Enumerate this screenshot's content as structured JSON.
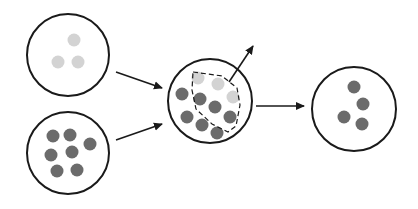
{
  "colors": {
    "background": "#ffffff",
    "outline": "#1a1a1a",
    "light_dot": "#d3d3d3",
    "dark_dot": "#6b6b6b"
  },
  "diagram": {
    "type": "flow",
    "nodes": [
      {
        "id": "source-light",
        "cx": 68,
        "cy": 55,
        "r": 41,
        "dots": [
          {
            "x": 74,
            "y": 40,
            "tone": "light"
          },
          {
            "x": 58,
            "y": 62,
            "tone": "light"
          },
          {
            "x": 78,
            "y": 62,
            "tone": "light"
          }
        ]
      },
      {
        "id": "source-dark",
        "cx": 68,
        "cy": 153,
        "r": 41,
        "dots": [
          {
            "x": 53,
            "y": 136,
            "tone": "dark"
          },
          {
            "x": 70,
            "y": 135,
            "tone": "dark"
          },
          {
            "x": 90,
            "y": 144,
            "tone": "dark"
          },
          {
            "x": 51,
            "y": 155,
            "tone": "dark"
          },
          {
            "x": 72,
            "y": 152,
            "tone": "dark"
          },
          {
            "x": 57,
            "y": 171,
            "tone": "dark"
          },
          {
            "x": 77,
            "y": 170,
            "tone": "dark"
          }
        ]
      },
      {
        "id": "combined",
        "cx": 210,
        "cy": 101,
        "r": 42,
        "dots": [
          {
            "x": 198,
            "y": 78,
            "tone": "light"
          },
          {
            "x": 218,
            "y": 84,
            "tone": "light"
          },
          {
            "x": 233,
            "y": 97,
            "tone": "light"
          },
          {
            "x": 182,
            "y": 94,
            "tone": "dark"
          },
          {
            "x": 200,
            "y": 99,
            "tone": "dark"
          },
          {
            "x": 215,
            "y": 107,
            "tone": "dark"
          },
          {
            "x": 230,
            "y": 117,
            "tone": "dark"
          },
          {
            "x": 187,
            "y": 117,
            "tone": "dark"
          },
          {
            "x": 202,
            "y": 125,
            "tone": "dark"
          },
          {
            "x": 217,
            "y": 133,
            "tone": "dark"
          }
        ]
      },
      {
        "id": "result",
        "cx": 354,
        "cy": 109,
        "r": 42,
        "dots": [
          {
            "x": 354,
            "y": 87,
            "tone": "dark"
          },
          {
            "x": 363,
            "y": 104,
            "tone": "dark"
          },
          {
            "x": 344,
            "y": 117,
            "tone": "dark"
          },
          {
            "x": 362,
            "y": 124,
            "tone": "dark"
          }
        ]
      }
    ],
    "dashed_subset": {
      "points": "193,72 222,76 237,88 240,105 236,126 228,132 212,124 196,109 192,90"
    },
    "edges": [
      {
        "id": "light-to-combined",
        "x1": 116,
        "y1": 72,
        "x2": 162,
        "y2": 88
      },
      {
        "id": "dark-to-combined",
        "x1": 116,
        "y1": 140,
        "x2": 162,
        "y2": 124
      },
      {
        "id": "subset-exit",
        "x1": 229,
        "y1": 82,
        "x2": 253,
        "y2": 46
      },
      {
        "id": "combined-to-result",
        "x1": 256,
        "y1": 106,
        "x2": 304,
        "y2": 106
      }
    ]
  }
}
